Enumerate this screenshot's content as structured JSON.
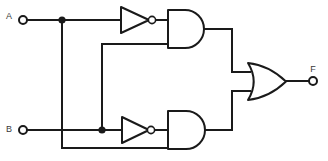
{
  "diagram": {
    "background_color": "#ffffff",
    "line_color": "#1a1a1a",
    "function_expression": "F = (NOT A AND B) OR (A AND NOT B)"
  },
  "terminals": {
    "input_a": {
      "label": "A",
      "label_x": 9,
      "label_y": 17,
      "node_x": 23,
      "node_y": 20,
      "radius": 4
    },
    "input_b": {
      "label": "B",
      "label_x": 9,
      "label_y": 130,
      "node_x": 23,
      "node_y": 130,
      "radius": 4
    },
    "output_f": {
      "label": "F",
      "label_x": 313,
      "label_y": 70,
      "node_x": 313,
      "node_y": 81,
      "radius": 4
    }
  },
  "junctions": [
    {
      "name": "a-branch-node",
      "x": 62,
      "y": 20,
      "radius": 3.6
    },
    {
      "name": "b-branch-node",
      "x": 102,
      "y": 130,
      "radius": 3.6
    }
  ],
  "gates": [
    {
      "name": "not-gate-a",
      "type": "NOT",
      "label": "NOT A",
      "x": 121,
      "y": 7,
      "width": 28,
      "height": 26,
      "bubble_x": 152,
      "bubble_y": 20,
      "bubble_r": 3.6
    },
    {
      "name": "and-gate-top",
      "type": "AND",
      "label": "A' AND B",
      "x": 168,
      "y": 10,
      "width": 36,
      "height": 38
    },
    {
      "name": "not-gate-b",
      "type": "NOT",
      "label": "NOT B",
      "x": 122,
      "y": 117,
      "width": 27,
      "height": 26,
      "bubble_x": 151,
      "bubble_y": 130,
      "bubble_r": 3.6
    },
    {
      "name": "and-gate-bottom",
      "type": "AND",
      "label": "A AND B'",
      "x": 168,
      "y": 111,
      "width": 37,
      "height": 38
    },
    {
      "name": "or-gate",
      "type": "OR",
      "label": "OR",
      "x": 248,
      "y": 63,
      "width": 38,
      "height": 37
    }
  ],
  "wires": [
    {
      "name": "a-input-lead",
      "path": "M 27 20 L 121 20"
    },
    {
      "name": "a-down-branch",
      "path": "M 62 20 L 62 148"
    },
    {
      "name": "a-to-bottom-and",
      "path": "M 62 148 L 168 148"
    },
    {
      "name": "not-a-to-and",
      "path": "M 156 20 L 168 20"
    },
    {
      "name": "b-input-lead",
      "path": "M 27 130 L 122 130"
    },
    {
      "name": "b-up-branch",
      "path": "M 102 130 L 102 44"
    },
    {
      "name": "b-to-top-and",
      "path": "M 102 44 L 168 44"
    },
    {
      "name": "not-b-to-and",
      "path": "M 155 130 L 168 130"
    },
    {
      "name": "top-and-output",
      "path": "M 204 29 L 232 29"
    },
    {
      "name": "top-and-to-or-bus",
      "path": "M 232 29 L 232 72"
    },
    {
      "name": "top-or-input-lead",
      "path": "M 232 72 L 250 72"
    },
    {
      "name": "bottom-and-output",
      "path": "M 205 130 L 232 130"
    },
    {
      "name": "bottom-and-to-or-bus",
      "path": "M 232 130 L 232 91"
    },
    {
      "name": "bottom-or-input-lead",
      "path": "M 232 91 L 250 91"
    },
    {
      "name": "or-output-lead",
      "path": "M 286 81 L 309 81"
    }
  ]
}
